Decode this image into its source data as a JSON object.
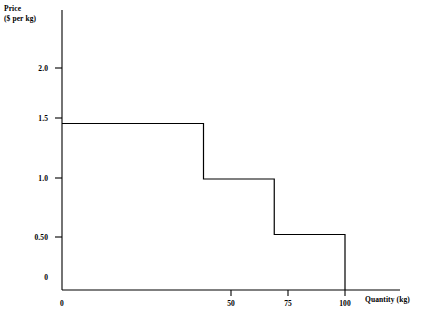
{
  "chart_data": {
    "type": "line",
    "subtype": "step",
    "title": "",
    "xlabel": "Quantity (kg)",
    "ylabel_lines": [
      "Price",
      "($ per kg)"
    ],
    "ylabel": "Price ($ per kg)",
    "grid": false,
    "legend": "none",
    "xlim": [
      0,
      115
    ],
    "ylim": [
      0,
      2.4
    ],
    "x_ticks": [
      {
        "value": 0,
        "label": "0"
      },
      {
        "value": 50,
        "label": "50"
      },
      {
        "value": 75,
        "label": "75"
      },
      {
        "value": 100,
        "label": "100"
      }
    ],
    "y_ticks": [
      {
        "value": 0,
        "label": "0"
      },
      {
        "value": 0.5,
        "label": "0.50"
      },
      {
        "value": 1.0,
        "label": "1.0"
      },
      {
        "value": 1.5,
        "label": "1.5"
      },
      {
        "value": 2.0,
        "label": "2.0"
      }
    ],
    "steps": [
      {
        "x_start": 0,
        "x_end": 50,
        "y": 1.5
      },
      {
        "x_start": 50,
        "x_end": 75,
        "y": 1.0
      },
      {
        "x_start": 75,
        "x_end": 100,
        "y": 0.5
      }
    ],
    "points": [
      {
        "x": 0,
        "y": 1.5
      },
      {
        "x": 50,
        "y": 1.5
      },
      {
        "x": 50,
        "y": 1.0
      },
      {
        "x": 75,
        "y": 1.0
      },
      {
        "x": 75,
        "y": 0.5
      },
      {
        "x": 100,
        "y": 0.5
      },
      {
        "x": 100,
        "y": 0
      }
    ],
    "series": [
      {
        "name": "Demand",
        "x": [
          0,
          50,
          50,
          75,
          75,
          100,
          100
        ],
        "values": [
          1.5,
          1.5,
          1.0,
          1.0,
          0.5,
          0.5,
          0
        ]
      }
    ],
    "line_color": "#000000",
    "axis_color": "#000000"
  }
}
